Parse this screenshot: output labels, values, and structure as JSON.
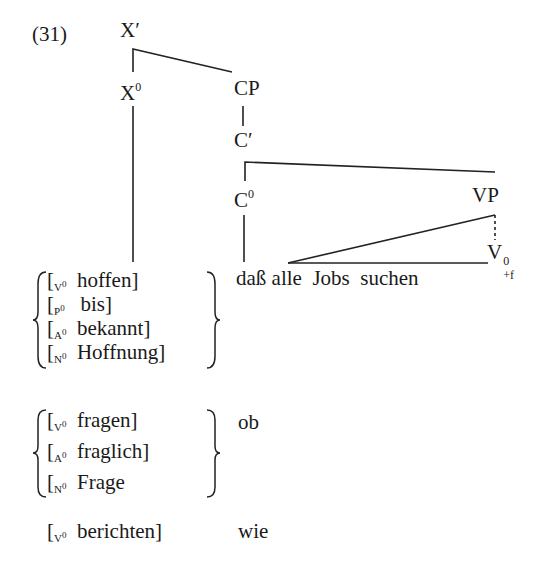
{
  "example_number": "(31)",
  "tree": {
    "root": {
      "label": "X",
      "prime": "′"
    },
    "head": {
      "label": "X",
      "sup": "0"
    },
    "cp": {
      "label": "CP"
    },
    "cbar": {
      "label": "C",
      "prime": "′"
    },
    "c0": {
      "label": "C",
      "sup": "0"
    },
    "vp": {
      "label": "VP"
    },
    "v0": {
      "label": "V",
      "sup": "0",
      "sub": "+f"
    },
    "clause": {
      "comp": "daß",
      "rest": "alle  Jobs  suchen"
    }
  },
  "groups": [
    {
      "complementizer": "daß",
      "items": [
        {
          "cat": "V",
          "sup": "0",
          "word": "hoffen]"
        },
        {
          "cat": "P",
          "sup": "0",
          "word": "bis]"
        },
        {
          "cat": "A",
          "sup": "0",
          "word": "bekannt]"
        },
        {
          "cat": "N",
          "sup": "0",
          "word": "Hoffnung]"
        }
      ]
    },
    {
      "complementizer": "ob",
      "items": [
        {
          "cat": "V",
          "sup": "0",
          "word": "fragen]"
        },
        {
          "cat": "A",
          "sup": "0",
          "word": "fraglich]"
        },
        {
          "cat": "N",
          "sup": "0",
          "word": "Frage"
        }
      ]
    },
    {
      "complementizer": "wie",
      "items": [
        {
          "cat": "V",
          "sup": "0",
          "word": "berichten]"
        }
      ]
    }
  ],
  "bracket_open": "["
}
